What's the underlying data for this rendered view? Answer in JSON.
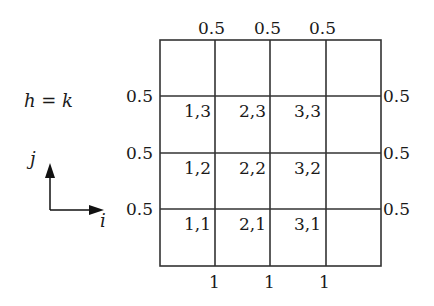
{
  "equation": "h = k",
  "axes": {
    "vertical_label": "j",
    "horizontal_label": "i"
  },
  "grid": {
    "columns": 4,
    "rows": 4,
    "cells": [
      {
        "label": "1,3",
        "col": 0,
        "row": 1
      },
      {
        "label": "2,3",
        "col": 1,
        "row": 1
      },
      {
        "label": "3,3",
        "col": 2,
        "row": 1
      },
      {
        "label": "1,2",
        "col": 0,
        "row": 2
      },
      {
        "label": "2,2",
        "col": 1,
        "row": 2
      },
      {
        "label": "3,2",
        "col": 2,
        "row": 2
      },
      {
        "label": "1,1",
        "col": 0,
        "row": 3
      },
      {
        "label": "2,1",
        "col": 1,
        "row": 3
      },
      {
        "label": "3,1",
        "col": 2,
        "row": 3
      }
    ]
  },
  "top_labels": [
    "0.5",
    "0.5",
    "0.5"
  ],
  "left_labels": [
    "0.5",
    "0.5",
    "0.5"
  ],
  "right_labels": [
    "0.5",
    "0.5",
    "0.5"
  ],
  "bottom_labels": [
    "1",
    "1",
    "1"
  ]
}
